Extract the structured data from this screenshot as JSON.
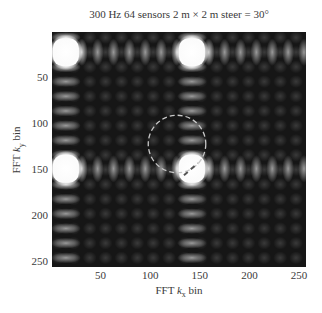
{
  "chart_data": {
    "type": "heatmap",
    "title": "300 Hz 64 sensors 2 m × 2 m steer = 30°",
    "xlabel": "FFT k_x bin",
    "ylabel": "FFT k_y bin",
    "xlabel_parts": {
      "prefix": "FFT ",
      "var": "k",
      "sub": "x",
      "suffix": " bin"
    },
    "ylabel_parts": {
      "prefix": "FFT ",
      "var": "k",
      "sub": "y",
      "suffix": " bin"
    },
    "x_ticks": [
      50,
      100,
      150,
      200,
      250
    ],
    "y_ticks": [
      50,
      100,
      150,
      200,
      250
    ],
    "xlim": [
      1,
      256
    ],
    "ylim": [
      1,
      256
    ],
    "y_axis_direction": "down",
    "colormap": "gray",
    "grid": false,
    "bright_peaks": [
      {
        "kx": 15,
        "ky": 23
      },
      {
        "kx": 142,
        "ky": 23
      },
      {
        "kx": 15,
        "ky": 150
      },
      {
        "kx": 142,
        "ky": 150
      }
    ],
    "sidelobe_spacing_bins": 16,
    "annotations": [
      {
        "type": "dashed-circle",
        "center_kx": 127,
        "center_ky": 123,
        "radius_bins": 29,
        "color": "#c8c8c8"
      },
      {
        "type": "dashed-line",
        "from_kx": 134,
        "from_ky": 157,
        "to_kx": 148,
        "to_ky": 144,
        "color": "#555555"
      }
    ]
  }
}
